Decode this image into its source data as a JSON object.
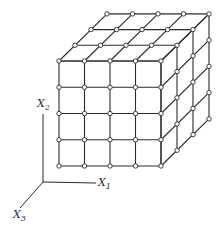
{
  "figure": {
    "colors": {
      "line": "#2a2a2a",
      "node_fill": "#ffffff",
      "background": "#ffffff"
    },
    "grid": {
      "nx": 4,
      "ny": 4,
      "nz": 3,
      "front_origin": [
        59,
        166
      ],
      "cell_w": 25.5,
      "cell_h": 26.25,
      "depth_step": [
        16,
        -15.7
      ],
      "node_radius": 2.2
    },
    "axes": {
      "origin": [
        43,
        182
      ],
      "x1": {
        "label": "X",
        "subscript": "1",
        "end": [
          96,
          183
        ],
        "label_pos": [
          98,
          186
        ]
      },
      "x2": {
        "label": "X",
        "subscript": "2",
        "end": [
          43,
          114
        ],
        "label_pos": [
          37,
          107
        ]
      },
      "x3": {
        "label": "X",
        "subscript": "3",
        "end": [
          20,
          208
        ],
        "label_pos": [
          13,
          218
        ]
      }
    }
  }
}
